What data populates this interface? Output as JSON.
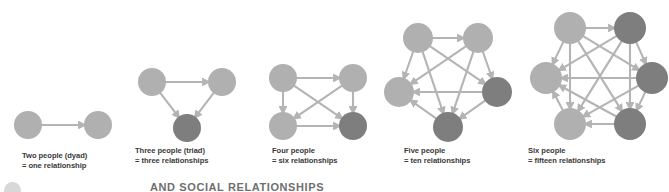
{
  "figure": {
    "title_partial": "AND SOCIAL RELATIONSHIPS",
    "background_color": "#ffffff",
    "node_light_color": "#b0b0b0",
    "node_dark_color": "#7e7e7e",
    "edge_color": "#b4b4b4",
    "caption_color": "#3a3a3a"
  },
  "groups": [
    {
      "id": "dyad",
      "node_count": 2,
      "relationship_count": 1,
      "caption_line1": "Two people (dyad)",
      "caption_line2": "= one relationship",
      "shape": "line",
      "nodes": [
        {
          "cx": 28,
          "cy": 125,
          "r": 14,
          "shade": "light"
        },
        {
          "cx": 98,
          "cy": 125,
          "r": 14,
          "shade": "light"
        }
      ],
      "edges": [
        [
          0,
          1
        ]
      ]
    },
    {
      "id": "triad",
      "node_count": 3,
      "relationship_count": 3,
      "caption_line1": "Three people (triad)",
      "caption_line2": "= three relationships",
      "shape": "triangle",
      "nodes": [
        {
          "cx": 152,
          "cy": 82,
          "r": 14,
          "shade": "light"
        },
        {
          "cx": 222,
          "cy": 82,
          "r": 14,
          "shade": "light"
        },
        {
          "cx": 187,
          "cy": 128,
          "r": 14,
          "shade": "dark"
        }
      ],
      "edges": [
        [
          0,
          1
        ],
        [
          0,
          2
        ],
        [
          1,
          2
        ]
      ]
    },
    {
      "id": "tetrad",
      "node_count": 4,
      "relationship_count": 6,
      "caption_line1": "Four people",
      "caption_line2": "= six relationships",
      "shape": "square",
      "nodes": [
        {
          "cx": 283,
          "cy": 78,
          "r": 14,
          "shade": "light"
        },
        {
          "cx": 353,
          "cy": 78,
          "r": 14,
          "shade": "light"
        },
        {
          "cx": 283,
          "cy": 126,
          "r": 14,
          "shade": "light"
        },
        {
          "cx": 353,
          "cy": 126,
          "r": 14,
          "shade": "dark"
        }
      ],
      "edges": [
        [
          0,
          1
        ],
        [
          0,
          2
        ],
        [
          0,
          3
        ],
        [
          1,
          2
        ],
        [
          1,
          3
        ],
        [
          2,
          3
        ]
      ]
    },
    {
      "id": "pentad",
      "node_count": 5,
      "relationship_count": 10,
      "caption_line1": "Five people",
      "caption_line2": "= ten relationships",
      "shape": "pentagon",
      "nodes": [
        {
          "cx": 418,
          "cy": 38,
          "r": 15,
          "shade": "light"
        },
        {
          "cx": 478,
          "cy": 38,
          "r": 15,
          "shade": "light"
        },
        {
          "cx": 497,
          "cy": 92,
          "r": 15,
          "shade": "dark"
        },
        {
          "cx": 448,
          "cy": 127,
          "r": 15,
          "shade": "dark"
        },
        {
          "cx": 399,
          "cy": 92,
          "r": 15,
          "shade": "light"
        }
      ],
      "edges": [
        [
          0,
          1
        ],
        [
          0,
          2
        ],
        [
          0,
          3
        ],
        [
          0,
          4
        ],
        [
          1,
          2
        ],
        [
          1,
          3
        ],
        [
          1,
          4
        ],
        [
          2,
          3
        ],
        [
          2,
          4
        ],
        [
          3,
          4
        ]
      ]
    },
    {
      "id": "hexad",
      "node_count": 6,
      "relationship_count": 15,
      "caption_line1": "Six people",
      "caption_line2": "= fifteen relationships",
      "shape": "hexagon",
      "nodes": [
        {
          "cx": 570,
          "cy": 28,
          "r": 16,
          "shade": "light"
        },
        {
          "cx": 630,
          "cy": 28,
          "r": 16,
          "shade": "dark"
        },
        {
          "cx": 652,
          "cy": 78,
          "r": 16,
          "shade": "dark"
        },
        {
          "cx": 630,
          "cy": 124,
          "r": 16,
          "shade": "dark"
        },
        {
          "cx": 570,
          "cy": 124,
          "r": 16,
          "shade": "light"
        },
        {
          "cx": 546,
          "cy": 78,
          "r": 16,
          "shade": "light"
        }
      ],
      "edges": [
        [
          0,
          1
        ],
        [
          0,
          2
        ],
        [
          0,
          3
        ],
        [
          0,
          4
        ],
        [
          0,
          5
        ],
        [
          1,
          2
        ],
        [
          1,
          3
        ],
        [
          1,
          4
        ],
        [
          1,
          5
        ],
        [
          2,
          3
        ],
        [
          2,
          4
        ],
        [
          2,
          5
        ],
        [
          3,
          4
        ],
        [
          3,
          5
        ],
        [
          4,
          5
        ]
      ]
    }
  ],
  "captions": [
    {
      "id": "dyad",
      "x": 22,
      "y": 151
    },
    {
      "id": "triad",
      "x": 135,
      "y": 146
    },
    {
      "id": "tetrad",
      "x": 272,
      "y": 146
    },
    {
      "id": "pentad",
      "x": 404,
      "y": 146
    },
    {
      "id": "hexad",
      "x": 528,
      "y": 146
    }
  ]
}
